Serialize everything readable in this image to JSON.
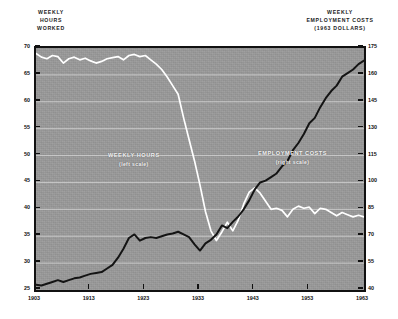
{
  "headers": {
    "left": [
      "WEEKLY",
      "HOURS",
      "WORKED"
    ],
    "right": [
      "WEEKLY",
      "EMPLOYMENT COSTS",
      "(1963 DOLLARS)"
    ]
  },
  "annotations": {
    "hours": {
      "title": "WEEKLY HOURS",
      "sub": "(left scale)"
    },
    "costs": {
      "title": "EMPLOYMENT COSTS",
      "sub": "(right scale)"
    }
  },
  "colors": {
    "plot_background": "#9a9a9a",
    "frame": "#111111",
    "gridline": "#d8d8d8",
    "hours_line": "#ffffff",
    "costs_line": "#141414",
    "page_background": "#ffffff",
    "text": "#101010"
  },
  "chart_data": {
    "type": "line",
    "title": "",
    "xlabel": "",
    "ylabel": "WEEKLY HOURS WORKED",
    "y2label": "WEEKLY EMPLOYMENT COSTS (1963 DOLLARS)",
    "grid": true,
    "legend": "in-plot annotations",
    "xlim": [
      1903,
      1963
    ],
    "xticks": [
      1903,
      1913,
      1923,
      1933,
      1943,
      1953,
      1963
    ],
    "xticklabels": [
      "1903",
      "1913",
      "1923",
      "1933",
      "1943",
      "1953",
      "1963"
    ],
    "ylim": [
      25,
      70
    ],
    "yticks": [
      25,
      30,
      35,
      40,
      45,
      50,
      55,
      60,
      65,
      70
    ],
    "yticklabels": [
      "25",
      "30",
      "35",
      "40",
      "45",
      "50",
      "55",
      "60",
      "65",
      "70"
    ],
    "y2lim": [
      40,
      175
    ],
    "y2ticks": [
      40,
      55,
      70,
      85,
      100,
      115,
      130,
      145,
      160,
      175
    ],
    "y2ticklabels": [
      "40",
      "55",
      "70",
      "85",
      "100",
      "115",
      "130",
      "145",
      "160",
      "175"
    ],
    "series": [
      {
        "name": "WEEKLY HOURS",
        "axis": "left",
        "color": "#ffffff",
        "x": [
          1903,
          1904,
          1905,
          1906,
          1907,
          1908,
          1909,
          1910,
          1911,
          1912,
          1913,
          1914,
          1915,
          1916,
          1917,
          1918,
          1919,
          1920,
          1921,
          1922,
          1923,
          1924,
          1925,
          1926,
          1927,
          1928,
          1929,
          1930,
          1931,
          1932,
          1933,
          1934,
          1935,
          1936,
          1937,
          1938,
          1939,
          1940,
          1941,
          1942,
          1943,
          1944,
          1945,
          1946,
          1947,
          1948,
          1949,
          1950,
          1951,
          1952,
          1953,
          1954,
          1955,
          1956,
          1957,
          1958,
          1959,
          1960,
          1961,
          1962,
          1963
        ],
        "y": [
          69.0,
          68.3,
          68.0,
          68.6,
          68.4,
          67.2,
          68.0,
          68.3,
          67.8,
          68.1,
          67.6,
          67.2,
          67.5,
          68.0,
          68.2,
          68.4,
          67.8,
          68.6,
          68.8,
          68.4,
          68.6,
          67.8,
          67.0,
          66.0,
          64.6,
          63.0,
          61.4,
          57.0,
          53.0,
          49.0,
          44.5,
          39.6,
          36.0,
          34.2,
          35.8,
          37.6,
          36.0,
          38.0,
          41.0,
          43.2,
          44.0,
          43.0,
          41.5,
          40.0,
          40.2,
          39.8,
          38.6,
          40.0,
          40.6,
          40.2,
          40.4,
          39.2,
          40.2,
          40.0,
          39.4,
          38.8,
          39.4,
          39.0,
          38.6,
          38.9,
          38.6
        ]
      },
      {
        "name": "EMPLOYMENT COSTS",
        "axis": "right",
        "color": "#141414",
        "x": [
          1903,
          1904,
          1905,
          1906,
          1907,
          1908,
          1909,
          1910,
          1911,
          1912,
          1913,
          1914,
          1915,
          1916,
          1917,
          1918,
          1919,
          1920,
          1921,
          1922,
          1923,
          1924,
          1925,
          1926,
          1927,
          1928,
          1929,
          1930,
          1931,
          1932,
          1933,
          1934,
          1935,
          1936,
          1937,
          1938,
          1939,
          1940,
          1941,
          1942,
          1943,
          1944,
          1945,
          1946,
          1947,
          1948,
          1949,
          1950,
          1951,
          1952,
          1953,
          1954,
          1955,
          1956,
          1957,
          1958,
          1959,
          1960,
          1961,
          1962,
          1963
        ],
        "y": [
          43.0,
          42.5,
          43.5,
          44.5,
          45.5,
          44.5,
          45.5,
          46.5,
          47.0,
          48.0,
          49.0,
          49.5,
          50.0,
          52.0,
          54.0,
          58.0,
          63.0,
          69.0,
          71.0,
          67.5,
          69.0,
          69.5,
          69.0,
          70.0,
          71.0,
          71.5,
          72.5,
          71.0,
          69.5,
          65.5,
          62.0,
          66.0,
          68.0,
          71.0,
          76.0,
          74.5,
          78.0,
          81.0,
          85.0,
          90.0,
          96.0,
          100.0,
          101.0,
          103.0,
          105.0,
          109.0,
          112.0,
          118.0,
          122.0,
          127.0,
          133.0,
          136.0,
          142.0,
          147.0,
          151.0,
          154.0,
          159.0,
          161.0,
          163.0,
          166.0,
          168.0
        ]
      }
    ]
  }
}
